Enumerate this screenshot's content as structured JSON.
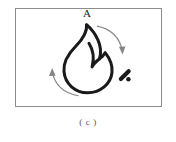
{
  "figure": {
    "caption": "( c )",
    "panel": {
      "label": "A",
      "border_color": "#8c8c8c",
      "background_color": "#ffffff"
    },
    "icons": {
      "flame": "flame-icon",
      "spark": "spark-mark-icon",
      "arrow_top_right": "curved-arrow-clockwise-icon",
      "arrow_bottom_left": "curved-arrow-counterclockwise-icon"
    },
    "colors": {
      "stroke": "#1a1a1a",
      "arrow": "#808080",
      "label": "#1a1a1a",
      "caption": "#555555"
    }
  }
}
